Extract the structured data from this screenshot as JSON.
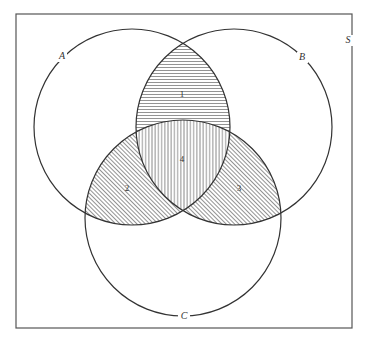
{
  "diagram": {
    "type": "venn-3-set",
    "universe": {
      "label": "S",
      "rect": {
        "x": 16,
        "y": 14,
        "w": 336,
        "h": 314
      }
    },
    "sets": [
      {
        "label": "A",
        "cx": 132,
        "cy": 127,
        "r": 98,
        "label_pos": {
          "x": 62,
          "y": 59
        }
      },
      {
        "label": "B",
        "cx": 234,
        "cy": 127,
        "r": 98,
        "label_pos": {
          "x": 303,
          "y": 60
        }
      },
      {
        "label": "C",
        "cx": 183,
        "cy": 218,
        "r": 98,
        "label_pos": {
          "x": 184,
          "y": 318
        }
      }
    ],
    "regions": [
      {
        "id": "1",
        "description": "A ∩ B only (not C)",
        "hatch": "horizontal",
        "label_pos": {
          "x": 182,
          "y": 96
        }
      },
      {
        "id": "2",
        "description": "A ∩ C only (not B)",
        "hatch": "diagonal",
        "label_pos": {
          "x": 127,
          "y": 190
        }
      },
      {
        "id": "3",
        "description": "B ∩ C only (not A)",
        "hatch": "diagonal",
        "label_pos": {
          "x": 239,
          "y": 190
        }
      },
      {
        "id": "4",
        "description": "A ∩ B ∩ C",
        "hatch": "vertical",
        "label_pos": {
          "x": 182,
          "y": 160
        }
      }
    ],
    "colors": {
      "stroke": "#333333",
      "hatch": "#555555",
      "background": "#ffffff"
    }
  }
}
